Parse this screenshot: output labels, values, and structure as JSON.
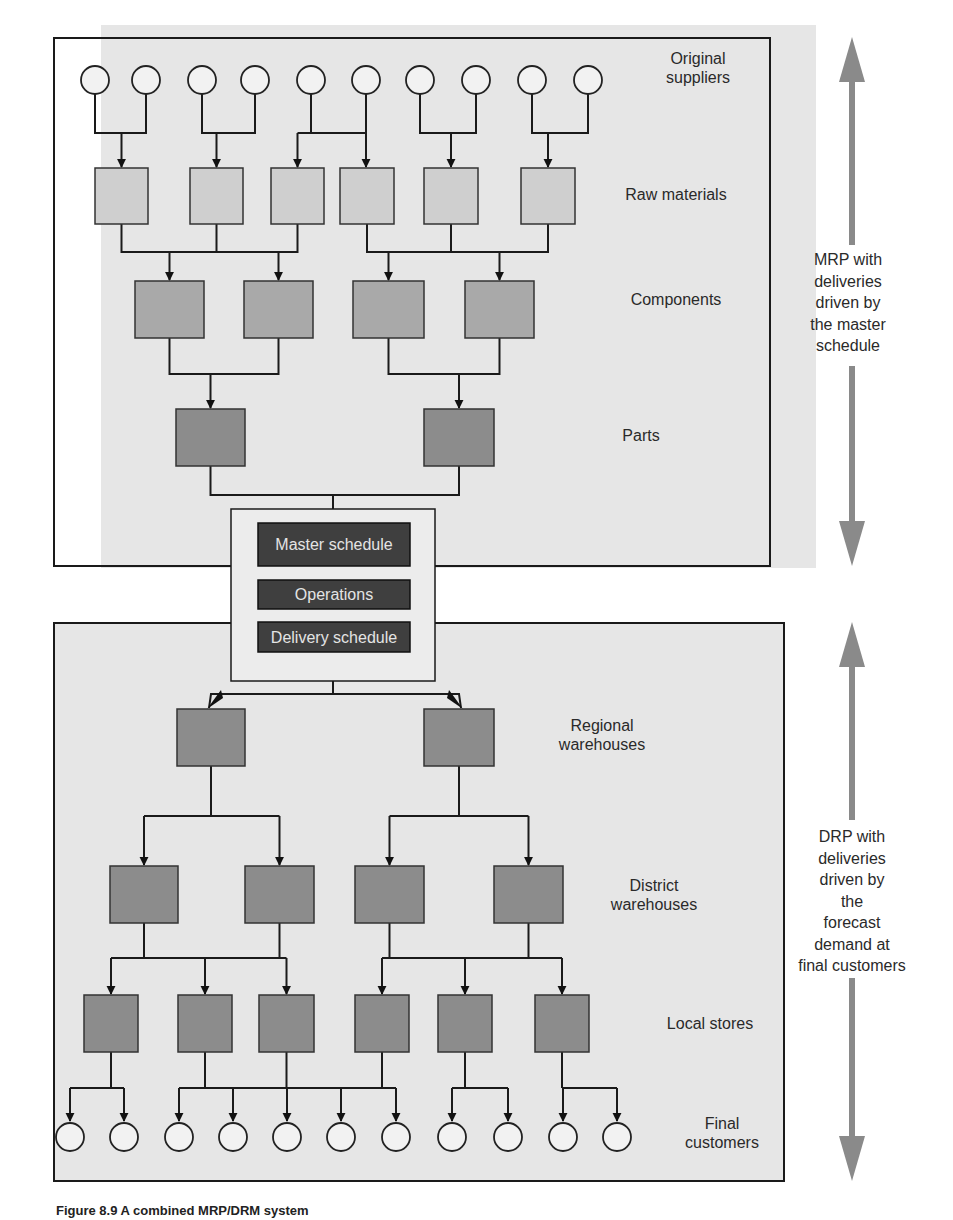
{
  "diagram": {
    "colors": {
      "panel_fill": "#e6e6e6",
      "light_box": "#cfcfcf",
      "mid_box": "#a9a9a9",
      "dark_box": "#8c8c8c",
      "schedule_box": "#3f3f3f",
      "side_arrow": "#8a8a8a",
      "line": "#1a1a1a"
    },
    "upper_section": {
      "name": "MRP",
      "levels": [
        {
          "label": [
            "Original",
            "suppliers"
          ],
          "kind": "circle",
          "count": 10
        },
        {
          "label": [
            "Raw materials"
          ],
          "kind": "box",
          "count": 6
        },
        {
          "label": [
            "Components"
          ],
          "kind": "box",
          "count": 4
        },
        {
          "label": [
            "Parts"
          ],
          "kind": "box",
          "count": 2
        }
      ],
      "side_note": [
        "MRP with",
        "deliveries",
        "driven by",
        "the master",
        "schedule"
      ]
    },
    "center": {
      "items": [
        "Master schedule",
        "Operations",
        "Delivery schedule"
      ]
    },
    "lower_section": {
      "name": "DRP",
      "levels": [
        {
          "label": [
            "Regional",
            "warehouses"
          ],
          "kind": "box",
          "count": 2
        },
        {
          "label": [
            "District",
            "warehouses"
          ],
          "kind": "box",
          "count": 4
        },
        {
          "label": [
            "Local stores"
          ],
          "kind": "box",
          "count": 6
        },
        {
          "label": [
            "Final",
            "customers"
          ],
          "kind": "circle",
          "count": 11
        }
      ],
      "side_note": [
        "DRP with",
        "deliveries",
        "driven by",
        "the",
        "forecast",
        "demand at",
        "final customers"
      ]
    },
    "caption": "Figure 8.9  A combined MRP/DRM system"
  }
}
